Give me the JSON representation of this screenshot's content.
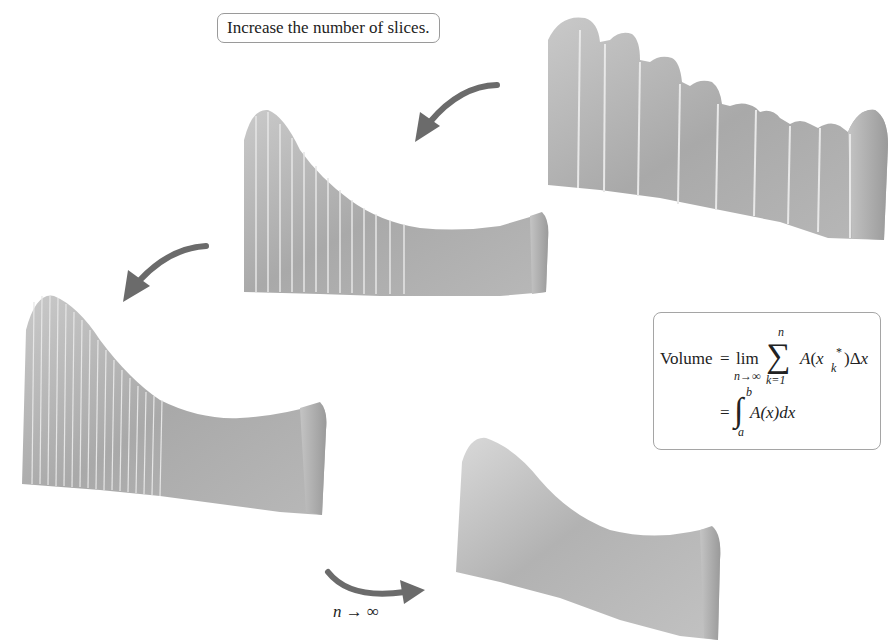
{
  "figure": {
    "callout_text": "Increase the number of slices.",
    "limit_label": {
      "var": "n",
      "arrow": "→",
      "target": "∞"
    },
    "solids": [
      {
        "id": "solid-few-slices",
        "slices": 10,
        "description": "Solid approximated by a few thick slices"
      },
      {
        "id": "solid-more-slices",
        "slices": 20,
        "description": "Solid approximated by more, thinner slices"
      },
      {
        "id": "solid-many-slices",
        "slices": 30,
        "description": "Solid approximated by many thin slices"
      },
      {
        "id": "solid-smooth",
        "slices": null,
        "description": "Smooth solid as n approaches infinity"
      }
    ],
    "arrows": [
      {
        "id": "arrow-1",
        "direction": "curved down-left"
      },
      {
        "id": "arrow-2",
        "direction": "curved down-left"
      },
      {
        "id": "arrow-3",
        "direction": "curved right"
      }
    ],
    "colors": {
      "solid_light": "#d4d4d4",
      "solid_dark": "#8e8e8e",
      "arrow": "#6b6b6b",
      "box_border": "#a5a5a5"
    }
  },
  "formula": {
    "lhs": "Volume",
    "eq1": "=",
    "lim": "lim",
    "lim_sub": "n→∞",
    "sigma": "∑",
    "sigma_top": "n",
    "sigma_bottom": "k=1",
    "summand_A": "A",
    "summand_open": "(",
    "summand_x": "x",
    "summand_star": "*",
    "summand_k": "k",
    "summand_close": ")Δ",
    "summand_dx": "x",
    "eq2": "=",
    "integral": "∫",
    "int_top": "b",
    "int_bottom": "a",
    "integrand": "A(x)dx"
  }
}
